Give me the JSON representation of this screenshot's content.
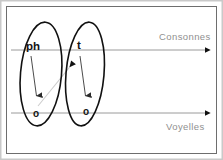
{
  "figure": {
    "title": "",
    "frame": {
      "outer_border_color": "#c9c9c9",
      "inner_border_color": "#6e6e6e",
      "background": "#ffffff"
    },
    "tiers": [
      {
        "id": "consonnes",
        "label": "Consonnes",
        "label_position": "above-right",
        "line_y": 50,
        "line_color": "#9a9a9a",
        "arrow": "right"
      },
      {
        "id": "voyelles",
        "label": "Voyelles",
        "label_position": "below-right",
        "line_y": 113,
        "line_color": "#9a9a9a",
        "arrow": "right"
      }
    ],
    "groups": [
      {
        "id": "group-1",
        "shape": "ellipse",
        "shape_color": "#111111",
        "consonant": "ph",
        "vowel": "o",
        "internal_arrow": {
          "from": "consonant",
          "to": "vowel",
          "direction": "down",
          "color": "#2a2a2a"
        }
      },
      {
        "id": "group-2",
        "shape": "ellipse",
        "shape_color": "#111111",
        "consonant": "t",
        "vowel": "o",
        "internal_arrow": {
          "from": "consonant",
          "to": "vowel",
          "direction": "down",
          "color": "#2a2a2a"
        }
      }
    ],
    "cross_link": {
      "id": "link-o1-to-t",
      "from_group": "group-1",
      "from_node": "vowel",
      "to_group": "group-2",
      "to_node": "consonant",
      "direction": "up-right",
      "line_color": "#cdcdcd",
      "arrowhead_color": "#111111"
    }
  }
}
